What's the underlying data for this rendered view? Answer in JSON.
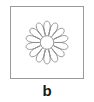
{
  "figure": {
    "caption": "b",
    "frame": {
      "shape": "square",
      "stroke_color": "#9a9a9a",
      "fill_color": "#ffffff",
      "stroke_width": 1,
      "left": 10,
      "top": 6,
      "width": 74,
      "height": 73
    },
    "background_color": "#ffffff",
    "caption_color": "#1a1a1a"
  },
  "motif": {
    "name": "fourteen-petal-rosette",
    "petal_count": 14,
    "line_color": "#8c8c8c",
    "fill_color": "none",
    "stroke_width": 0.9,
    "center": {
      "x": 37,
      "y": 35.5
    },
    "center_circle_radius": 7,
    "petal_inner_radius": 8.5,
    "petal_outer_radius": 22,
    "petal_half_width_deg": 12.6,
    "has_radial_spokes": true,
    "spoke_count": 14
  }
}
